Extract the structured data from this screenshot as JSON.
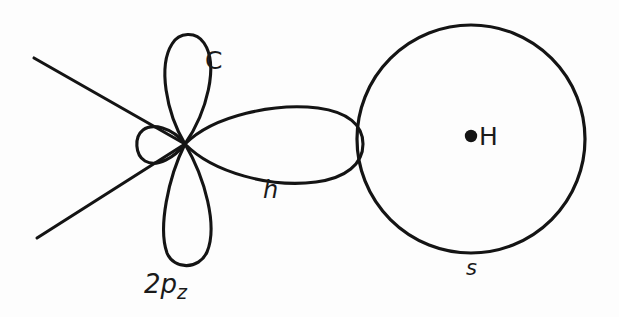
{
  "figure": {
    "background_color": "#fdfdfd",
    "stroke_color": "#141414",
    "labels": {
      "carbon_lobe": "C",
      "carbon_p_orbital": "2p",
      "carbon_p_orbital_subscript": "z",
      "hybrid_orbital": "h",
      "hydrogen_atom": "H",
      "hydrogen_s_orbital": "s"
    },
    "geometry": {
      "carbon_node": {
        "x": 185,
        "y": 144
      },
      "hydrogen_center": {
        "x": 471,
        "y": 139
      },
      "hydrogen_radius": 114,
      "hydrogen_nucleus_dot": {
        "x": 471,
        "y": 136,
        "r": 6
      },
      "p_lobe_top_tip": {
        "x": 186,
        "y": 34
      },
      "p_lobe_bottom_tip": {
        "x": 183,
        "y": 266
      },
      "hybrid_lobe_tip": {
        "x": 362,
        "y": 144
      },
      "back_lobe_tip": {
        "x": 139,
        "y": 146
      },
      "bond_line_upper_end": {
        "x": 34,
        "y": 58
      },
      "bond_line_lower_end": {
        "x": 37,
        "y": 238
      }
    }
  }
}
